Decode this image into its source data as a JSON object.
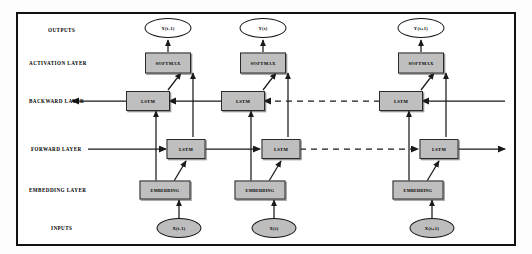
{
  "figure": {
    "type": "diagram",
    "border_color": "#111111",
    "box_fill": "#bfbfbf",
    "input_ellipse_fill": "#bdbdbd",
    "output_ellipse_fill": "#ffffff"
  },
  "row_labels": [
    {
      "id": "outputs",
      "label": "OUTPUTS",
      "y": 30
    },
    {
      "id": "activation",
      "label": "ACTIVATION LAYER",
      "y": 63
    },
    {
      "id": "backward",
      "label": "BACKWARD LAYER",
      "y": 101
    },
    {
      "id": "forward",
      "label": "FORWARD LAYER",
      "y": 149
    },
    {
      "id": "embedding",
      "label": "EMBEDDING LAYER",
      "y": 190
    },
    {
      "id": "inputs",
      "label": "INPUTS",
      "y": 228
    }
  ],
  "timesteps": [
    {
      "id": "t-minus-1",
      "output": "Y(t-1)",
      "softmax": "SOFTMAX",
      "backward": "LSTM",
      "forward": "LSTM",
      "embedding": "EMBEDDING",
      "input": "X(t-1)"
    },
    {
      "id": "t",
      "output": "Y(t)",
      "softmax": "SOFTMAX",
      "backward": "LSTM",
      "forward": "LSTM",
      "embedding": "EMBEDDING",
      "input": "X(t)"
    },
    {
      "id": "t-plus-1",
      "output": "Y(t+1)",
      "softmax": "SOFTMAX",
      "backward": "LSTM",
      "forward": "LSTM",
      "embedding": "EMBEDDING",
      "input": "X(t+1)"
    }
  ]
}
